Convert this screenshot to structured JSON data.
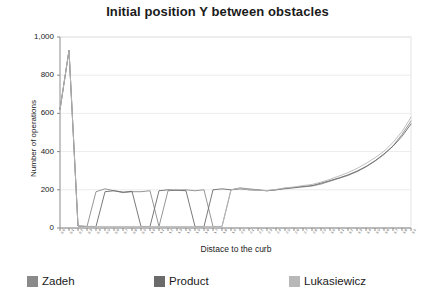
{
  "chart_data": {
    "type": "line",
    "title": "Initial position Y between obstacles",
    "xlabel": "Distace to the curb",
    "ylabel": "Number of operations",
    "ylim": [
      0,
      1000
    ],
    "yticks": [
      "0",
      "200",
      "400",
      "600",
      "800",
      "1,000"
    ],
    "ytick_values": [
      0,
      200,
      400,
      600,
      800,
      1000
    ],
    "grid": true,
    "grid_axis": "y",
    "legend_position": "bottom",
    "x": [
      0,
      1,
      2,
      3,
      4,
      5,
      6,
      7,
      8,
      9,
      10,
      11,
      12,
      13,
      14,
      15,
      16,
      17,
      18,
      19,
      20,
      21,
      22,
      23,
      24,
      25,
      26,
      27,
      28,
      29,
      30,
      31,
      32,
      33,
      34,
      35,
      36,
      37,
      38,
      39
    ],
    "xtick_labels": [
      "0.0",
      "0.1",
      "0.2",
      "0.3",
      "0.4",
      "0.5",
      "0.6",
      "0.7",
      "0.8",
      "0.9",
      "1.0",
      "1.1",
      "1.2",
      "1.3",
      "1.4",
      "1.5",
      "1.6",
      "1.7",
      "1.8",
      "1.9",
      "2.0",
      "2.1",
      "2.2",
      "2.3",
      "2.4",
      "2.5",
      "2.6",
      "2.7",
      "2.8",
      "2.9",
      "3.0",
      "3.1",
      "3.2",
      "3.3",
      "3.4",
      "3.5",
      "3.6",
      "3.7",
      "3.8",
      "3.9"
    ],
    "series": [
      {
        "name": "Zadeh",
        "color": "#8a8a8a",
        "values": [
          620,
          930,
          10,
          8,
          190,
          205,
          195,
          185,
          190,
          190,
          195,
          8,
          195,
          198,
          200,
          195,
          200,
          8,
          8,
          200,
          210,
          205,
          200,
          195,
          200,
          205,
          210,
          215,
          220,
          230,
          245,
          260,
          275,
          295,
          320,
          350,
          385,
          430,
          490,
          560
        ]
      },
      {
        "name": "Product",
        "color": "#6b6b6b",
        "values": [
          620,
          930,
          10,
          8,
          8,
          190,
          195,
          188,
          192,
          8,
          8,
          195,
          200,
          198,
          195,
          8,
          8,
          200,
          205,
          200,
          205,
          200,
          198,
          195,
          200,
          208,
          212,
          218,
          222,
          235,
          248,
          262,
          278,
          298,
          322,
          352,
          388,
          428,
          480,
          545
        ]
      },
      {
        "name": "Lukasiewicz",
        "color": "#b8b8b8",
        "values": [
          620,
          930,
          10,
          8,
          8,
          8,
          8,
          8,
          8,
          8,
          8,
          8,
          8,
          8,
          8,
          8,
          8,
          8,
          8,
          200,
          208,
          200,
          198,
          196,
          202,
          210,
          215,
          222,
          228,
          240,
          255,
          272,
          290,
          312,
          338,
          368,
          402,
          448,
          505,
          580
        ]
      }
    ]
  },
  "axes": {
    "y_title": "Number of operations",
    "x_title": "Distace to the curb"
  }
}
